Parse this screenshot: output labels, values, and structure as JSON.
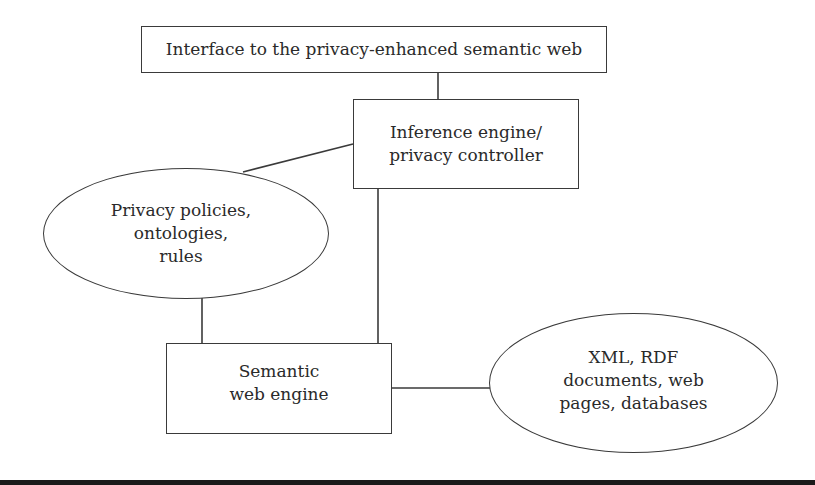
{
  "diagram": {
    "nodes": {
      "interface": {
        "shape": "rectangle",
        "label": "Interface to the privacy-enhanced semantic web"
      },
      "inference": {
        "shape": "rectangle",
        "label": "Inference engine/\nprivacy controller"
      },
      "policies": {
        "shape": "ellipse",
        "label": "Privacy policies,\nontologies,\nrules"
      },
      "semantic_engine": {
        "shape": "rectangle",
        "label": "Semantic\nweb engine"
      },
      "documents": {
        "shape": "ellipse",
        "label": "XML, RDF\ndocuments, web\npages, databases"
      }
    },
    "edges": [
      {
        "from": "interface",
        "to": "inference"
      },
      {
        "from": "inference",
        "to": "policies"
      },
      {
        "from": "inference",
        "to": "semantic_engine"
      },
      {
        "from": "policies",
        "to": "semantic_engine"
      },
      {
        "from": "semantic_engine",
        "to": "documents"
      }
    ],
    "colors": {
      "stroke": "#3a3a3a",
      "text": "#2a2a2a",
      "background": "#ffffff",
      "bottom_rule": "#1a1a1a"
    }
  }
}
